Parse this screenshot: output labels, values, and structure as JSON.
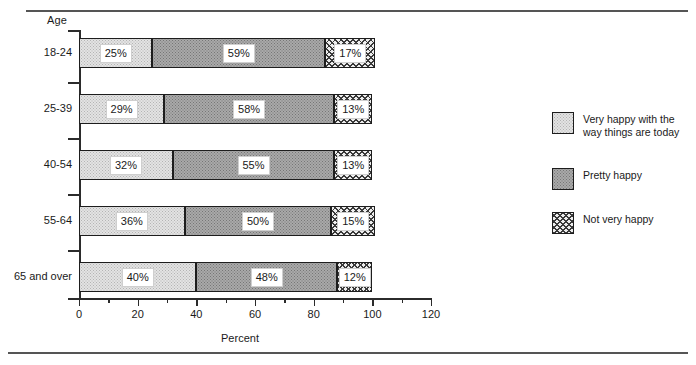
{
  "rules": {
    "top": "horizontal-rule",
    "bottom": "horizontal-rule"
  },
  "chart_data": {
    "type": "bar",
    "orientation": "horizontal",
    "stacked": true,
    "title": "",
    "xlabel": "Percent",
    "ylabel": "Age",
    "xlim": [
      0,
      120
    ],
    "xticks": [
      0,
      20,
      40,
      60,
      80,
      100,
      120
    ],
    "xtick_labels": [
      "0",
      "20",
      "40",
      "60",
      "80",
      "100",
      "120"
    ],
    "minor_xticks": [
      10,
      30,
      50,
      70,
      90,
      110
    ],
    "grid": false,
    "legend_position": "right",
    "categories": [
      "18-24",
      "25-39",
      "40-54",
      "55-64",
      "65 and over"
    ],
    "series": [
      {
        "name": "Very happy with the\nway  things are today",
        "pattern": "light-dotted",
        "values": [
          25,
          29,
          32,
          36,
          40
        ],
        "labels": [
          "25%",
          "29%",
          "32%",
          "36%",
          "40%"
        ]
      },
      {
        "name": "Pretty happy",
        "pattern": "mid-dotted",
        "values": [
          59,
          58,
          55,
          50,
          48
        ],
        "labels": [
          "59%",
          "58%",
          "55%",
          "50%",
          "48%"
        ]
      },
      {
        "name": "Not very happy",
        "pattern": "crosshatch",
        "values": [
          17,
          13,
          13,
          15,
          12
        ],
        "labels": [
          "17%",
          "13%",
          "13%",
          "15%",
          "12%"
        ]
      }
    ]
  },
  "axis": {
    "y_title": "Age",
    "x_title": "Percent"
  },
  "legend": {
    "items": [
      {
        "label": "Very happy with the\nway  things are today",
        "pattern": "light-dotted"
      },
      {
        "label": "Pretty happy",
        "pattern": "mid-dotted"
      },
      {
        "label": "Not very happy",
        "pattern": "crosshatch"
      }
    ]
  },
  "colors": {
    "axis": "#2b2b2b",
    "rule": "#555555",
    "segment_border": "#1d1d1d",
    "light": "#e3e3e3",
    "mid": "#a9a9a9",
    "cross": "#ededed"
  }
}
